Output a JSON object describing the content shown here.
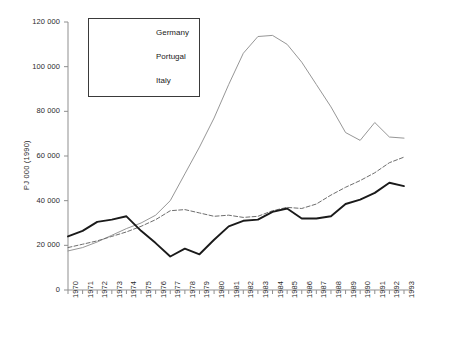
{
  "chart_data": {
    "type": "line",
    "title": "",
    "xlabel": "",
    "ylabel": "PJ 000 (1990)",
    "xlim": [
      1970,
      1993
    ],
    "ylim": [
      0,
      120000
    ],
    "ytick_step": 20000,
    "grid": false,
    "legend_position": "top-left",
    "categories": [
      1970,
      1971,
      1972,
      1973,
      1974,
      1975,
      1976,
      1977,
      1978,
      1979,
      1980,
      1981,
      1982,
      1983,
      1984,
      1985,
      1986,
      1987,
      1988,
      1989,
      1990,
      1991,
      1992,
      1993
    ],
    "series": [
      {
        "name": "Germany",
        "style": "solid-thin",
        "color": "#8a8a8a",
        "values": [
          17500,
          19000,
          21500,
          24500,
          27500,
          30000,
          33500,
          40000,
          52000,
          64000,
          77000,
          92000,
          106000,
          113500,
          114000,
          110000,
          102000,
          92000,
          82000,
          70500,
          67000,
          75000,
          68500,
          68000
        ]
      },
      {
        "name": "Portugal",
        "style": "dashed",
        "color": "#6e6e6e",
        "values": [
          19000,
          20500,
          22000,
          24000,
          26000,
          28500,
          31500,
          35500,
          36000,
          34500,
          33000,
          33500,
          32500,
          33000,
          35500,
          37000,
          36500,
          38500,
          42500,
          46000,
          49000,
          52500,
          57000,
          59500
        ]
      },
      {
        "name": "Italy",
        "style": "solid-thick",
        "color": "#1a1a1a",
        "values": [
          24000,
          26500,
          30500,
          31500,
          33000,
          26500,
          21000,
          15000,
          18500,
          16000,
          22500,
          28500,
          31000,
          31500,
          35000,
          36500,
          32000,
          32000,
          33000,
          38500,
          40500,
          43500,
          48000,
          46500
        ]
      }
    ]
  },
  "legend": {
    "items": [
      {
        "label": "Germany"
      },
      {
        "label": "Portugal"
      },
      {
        "label": "Italy"
      }
    ]
  },
  "axes": {
    "y_ticks": [
      "0",
      "20 000",
      "40 000",
      "60 000",
      "80 000",
      "100 000",
      "120 000"
    ],
    "x_ticks": [
      "1970",
      "1971",
      "1972",
      "1973",
      "1974",
      "1975",
      "1976",
      "1977",
      "1978",
      "1979",
      "1980",
      "1981",
      "1982",
      "1983",
      "1984",
      "1985",
      "1986",
      "1987",
      "1988",
      "1989",
      "1990",
      "1991",
      "1992",
      "1993"
    ]
  }
}
